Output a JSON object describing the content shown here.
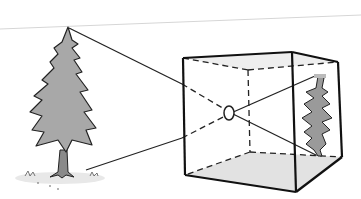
{
  "illustration": {
    "subject": "camera obscura / pinhole camera diagram",
    "elements": [
      "tree",
      "light-rays",
      "box",
      "pinhole",
      "inverted-tree-image"
    ],
    "colors": {
      "background": "#ffffff",
      "ink": "#1e1e1e",
      "tree_fill": "#9a9a9a",
      "box_shade": "#dcdcdc",
      "horizon": "#d0d0d0"
    }
  }
}
